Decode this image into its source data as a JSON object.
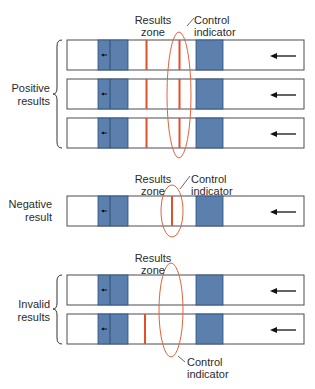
{
  "colors": {
    "strip_border": "#4a4a55",
    "pad_blue": "#5b80ad",
    "pad_line": "#2d4f7a",
    "test_line": "#e0502a",
    "ellipse": "#e0643c",
    "arrow": "#111111"
  },
  "groups": {
    "positive": {
      "label_line1": "Positive",
      "label_line2": "results"
    },
    "negative": {
      "label_line1": "Negative",
      "label_line2": "result"
    },
    "invalid": {
      "label_line1": "Invalid",
      "label_line2": "results"
    }
  },
  "annotations": {
    "results_zone_line1": "Results",
    "results_zone_line2": "zone",
    "control_line1": "Control",
    "control_line2": "indicator"
  },
  "strips": [
    {
      "group": "positive",
      "test_line": true,
      "control_line": true
    },
    {
      "group": "positive",
      "test_line": true,
      "control_line": true
    },
    {
      "group": "positive",
      "test_line": true,
      "control_line": true
    },
    {
      "group": "negative",
      "test_line": false,
      "control_line": true
    },
    {
      "group": "invalid",
      "test_line": false,
      "control_line": false
    },
    {
      "group": "invalid",
      "test_line": true,
      "control_line": false
    }
  ]
}
